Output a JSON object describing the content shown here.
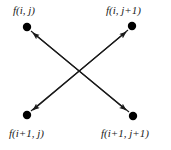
{
  "figure": {
    "type": "diagram",
    "background_color": "#ffffff",
    "stroke_color": "#1a1a1a",
    "node_color": "#000000",
    "nodes": [
      {
        "id": "top-left",
        "label": "f(i, j)",
        "cx": 27,
        "cy": 27,
        "r": 4,
        "label_x": 13,
        "label_y": 5
      },
      {
        "id": "top-right",
        "label": "f(i, j+1)",
        "cx": 132,
        "cy": 26,
        "r": 4,
        "label_x": 106,
        "label_y": 5
      },
      {
        "id": "bottom-left",
        "label": "f(i+1, j)",
        "cx": 27,
        "cy": 115,
        "r": 4,
        "label_x": 9,
        "label_y": 128
      },
      {
        "id": "bottom-right",
        "label": "f(i+1, j+1)",
        "cx": 133,
        "cy": 116,
        "r": 4,
        "label_x": 101,
        "label_y": 128
      }
    ],
    "arrows": [
      {
        "id": "bottom-right-to-top-left",
        "from": "bottom-right",
        "to": "top-left",
        "x1": 129,
        "y1": 112,
        "x2": 31,
        "y2": 31
      },
      {
        "id": "bottom-left-to-top-right",
        "from": "bottom-left",
        "to": "top-right",
        "x1": 31,
        "y1": 111,
        "x2": 128,
        "y2": 30
      },
      {
        "id": "top-right-to-bottom-left",
        "from": "top-right",
        "to": "bottom-left",
        "x1": 128,
        "y1": 30,
        "x2": 31,
        "y2": 111
      },
      {
        "id": "top-left-to-bottom-right",
        "from": "top-left",
        "to": "bottom-right",
        "x1": 31,
        "y1": 31,
        "x2": 129,
        "y2": 112
      }
    ],
    "crossing_point": {
      "x": 80,
      "y": 71
    }
  }
}
